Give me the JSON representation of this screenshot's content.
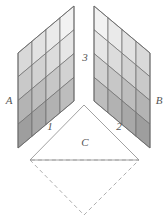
{
  "diagram": {
    "type": "geometric-projection-diagram",
    "canvas": {
      "width": 168,
      "height": 220,
      "background": "#ffffff"
    },
    "labels": {
      "panel_left": "A",
      "panel_right": "B",
      "base_triangle": "C",
      "edge_left": "1",
      "edge_right": "2",
      "edge_top": "3"
    },
    "label_positions": {
      "panel_left": {
        "x": 9,
        "y": 101
      },
      "panel_right": {
        "x": 159,
        "y": 101
      },
      "base_triangle": {
        "x": 85,
        "y": 143
      },
      "edge_left": {
        "x": 50,
        "y": 127
      },
      "edge_right": {
        "x": 119,
        "y": 127
      },
      "edge_top": {
        "x": 85,
        "y": 58
      }
    },
    "panels": [
      {
        "name": "panel-A",
        "label": "A",
        "rows": 4,
        "cols": 4,
        "corners": {
          "top_left": {
            "x": 18,
            "y": 53
          },
          "top_right": {
            "x": 74,
            "y": 6
          },
          "bottom_right": {
            "x": 74,
            "y": 101
          },
          "bottom_left": {
            "x": 18,
            "y": 148
          }
        },
        "cell_shades": [
          [
            "#d9d9d9",
            "#e2e2e2",
            "#eaeaea",
            "#f2f2f2"
          ],
          [
            "#c9c9c9",
            "#d2d2d2",
            "#dcdcdc",
            "#e6e6e6"
          ],
          [
            "#b4b4b4",
            "#bdbdbd",
            "#c7c7c7",
            "#d2d2d2"
          ],
          [
            "#9e9e9e",
            "#a8a8a8",
            "#b2b2b2",
            "#bdbdbd"
          ]
        ],
        "stroke": "#6b6b6b",
        "stroke_width": 0.7
      },
      {
        "name": "panel-B",
        "label": "B",
        "rows": 4,
        "cols": 4,
        "corners": {
          "top_left": {
            "x": 94,
            "y": 6
          },
          "top_right": {
            "x": 150,
            "y": 53
          },
          "bottom_right": {
            "x": 150,
            "y": 148
          },
          "bottom_left": {
            "x": 94,
            "y": 101
          }
        },
        "cell_shades": [
          [
            "#f2f2f2",
            "#eaeaea",
            "#e2e2e2",
            "#d9d9d9"
          ],
          [
            "#e6e6e6",
            "#dcdcdc",
            "#d2d2d2",
            "#c9c9c9"
          ],
          [
            "#d2d2d2",
            "#c7c7c7",
            "#bdbdbd",
            "#b4b4b4"
          ],
          [
            "#bdbdbd",
            "#b2b2b2",
            "#a8a8a8",
            "#9e9e9e"
          ]
        ],
        "stroke": "#6b6b6b",
        "stroke_width": 0.7
      }
    ],
    "base": {
      "name": "rhombic-base",
      "vertices": {
        "top": {
          "x": 84,
          "y": 105
        },
        "left": {
          "x": 30,
          "y": 160
        },
        "right": {
          "x": 139,
          "y": 160
        },
        "bottom": {
          "x": 84,
          "y": 215
        }
      },
      "upper_triangle": {
        "label": "C",
        "line_style": "solid",
        "stroke": "#8a8a8a",
        "fill": "#ffffff"
      },
      "lower_triangle": {
        "line_style": "dashed",
        "stroke": "#9a9a9a",
        "dash_pattern": "4 3",
        "fill": "none"
      }
    },
    "colors": {
      "stroke_panel": "#6b6b6b",
      "stroke_base": "#8a8a8a",
      "stroke_dashed": "#9a9a9a",
      "label_text": "#555555",
      "background": "#ffffff"
    }
  }
}
